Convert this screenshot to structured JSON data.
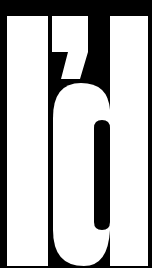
{
  "text": "I'd",
  "colors": {
    "background": "#000000",
    "foreground": "#ffffff"
  }
}
